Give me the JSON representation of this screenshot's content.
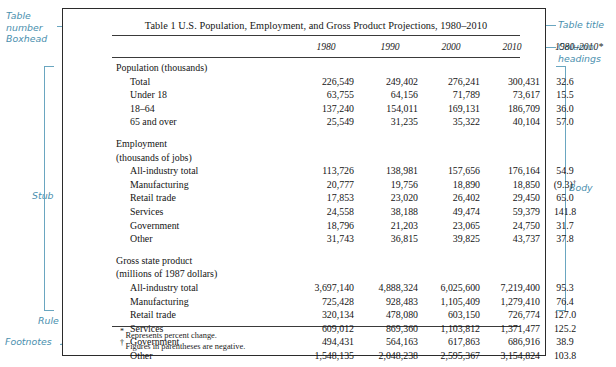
{
  "table": {
    "title": "Table 1  U.S. Population, Employment, and Gross Product Projections, 1980–2010",
    "column_headings": [
      "1980",
      "1990",
      "2000",
      "2010",
      "1980–2010*"
    ],
    "sections": [
      {
        "heading_lines": [
          "Population (thousands)"
        ],
        "rows": [
          {
            "stub": "Total",
            "values": [
              "226,549",
              "249,402",
              "276,241",
              "300,431",
              "32.6"
            ]
          },
          {
            "stub": "Under 18",
            "values": [
              "63,755",
              "64,156",
              "71,789",
              "73,617",
              "15.5"
            ]
          },
          {
            "stub": "18–64",
            "values": [
              "137,240",
              "154,011",
              "169,131",
              "186,709",
              "36.0"
            ]
          },
          {
            "stub": "65 and over",
            "values": [
              "25,549",
              "31,235",
              "35,322",
              "40,104",
              "57.0"
            ]
          }
        ]
      },
      {
        "heading_lines": [
          "Employment",
          "(thousands of jobs)"
        ],
        "rows": [
          {
            "stub": "All-industry total",
            "values": [
              "113,726",
              "138,981",
              "157,656",
              "176,164",
              "54.9"
            ]
          },
          {
            "stub": "Manufacturing",
            "values": [
              "20,777",
              "19,756",
              "18,890",
              "18,850",
              "(9.3)†"
            ]
          },
          {
            "stub": "Retail trade",
            "values": [
              "17,853",
              "23,020",
              "26,402",
              "29,450",
              "65.0"
            ]
          },
          {
            "stub": "Services",
            "values": [
              "24,558",
              "38,188",
              "49,474",
              "59,379",
              "141.8"
            ]
          },
          {
            "stub": "Government",
            "values": [
              "18,796",
              "21,203",
              "23,065",
              "24,750",
              "31.7"
            ]
          },
          {
            "stub": "Other",
            "values": [
              "31,743",
              "36,815",
              "39,825",
              "43,737",
              "37.8"
            ]
          }
        ]
      },
      {
        "heading_lines": [
          "Gross state product",
          "(millions of 1987 dollars)"
        ],
        "rows": [
          {
            "stub": "All-industry total",
            "values": [
              "3,697,140",
              "4,888,324",
              "6,025,600",
              "7,219,400",
              "95.3"
            ]
          },
          {
            "stub": "Manufacturing",
            "values": [
              "725,428",
              "928,483",
              "1,105,409",
              "1,279,410",
              "76.4"
            ]
          },
          {
            "stub": "Retail trade",
            "values": [
              "320,134",
              "478,080",
              "603,150",
              "726,774",
              "127.0"
            ]
          },
          {
            "stub": "Services",
            "values": [
              "609,012",
              "869,360",
              "1,103,812",
              "1,371,477",
              "125.2"
            ]
          },
          {
            "stub": "Government",
            "values": [
              "494,431",
              "564,163",
              "617,863",
              "686,916",
              "38.9"
            ]
          },
          {
            "stub": "Other",
            "values": [
              "1,548,135",
              "2,048,238",
              "2,595,367",
              "3,154,824",
              "103.8"
            ]
          }
        ]
      }
    ],
    "footnotes": [
      {
        "marker": "*",
        "text": "Represents percent change."
      },
      {
        "marker": "†",
        "text": "Figures in parentheses are negative."
      }
    ]
  },
  "annotations": {
    "accent_color": "#6aa6c0",
    "left": [
      {
        "id": "table-number",
        "lines": [
          "Table",
          "number"
        ]
      },
      {
        "id": "boxhead",
        "lines": [
          "Boxhead"
        ]
      },
      {
        "id": "stub",
        "lines": [
          "Stub"
        ]
      },
      {
        "id": "rule",
        "lines": [
          "Rule"
        ]
      },
      {
        "id": "footnotes",
        "lines": [
          "Footnotes"
        ]
      }
    ],
    "right": [
      {
        "id": "table-title",
        "lines": [
          "Table title"
        ]
      },
      {
        "id": "column-headings",
        "lines": [
          "Column",
          "headings"
        ]
      },
      {
        "id": "body",
        "lines": [
          "Body"
        ]
      }
    ]
  }
}
